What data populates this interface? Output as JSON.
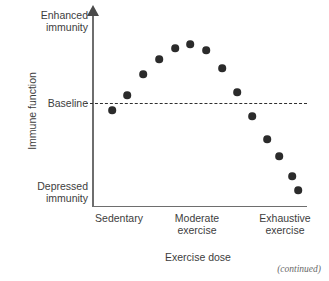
{
  "figure": {
    "continued_note": "(continued)"
  },
  "chart_data": {
    "type": "scatter",
    "title": "",
    "xlabel": "Exercise dose",
    "ylabel": "Immune function",
    "grid": false,
    "legend": null,
    "xlim": [
      0,
      1
    ],
    "ylim": [
      0,
      1
    ],
    "x_tick_labels": [
      "Sedentary",
      "Moderate\nexercise",
      "Exhaustive\nexercise"
    ],
    "y_tick_labels": [
      "Enhanced\nimmunity",
      "Baseline",
      "Depressed\nimmunity"
    ],
    "annotations": [
      {
        "name": "baseline-reference-line",
        "label": "Baseline",
        "style": "dashed",
        "y": 0.5
      }
    ],
    "marker": {
      "shape": "circle",
      "color": "#2b2b2b",
      "size_px": 7.6
    },
    "point_count": 14,
    "points": [
      {
        "x": 0.09,
        "y": 0.475,
        "px": 112,
        "py": 110
      },
      {
        "x": 0.16,
        "y": 0.555,
        "px": 127,
        "py": 95
      },
      {
        "x": 0.235,
        "y": 0.665,
        "px": 143,
        "py": 74
      },
      {
        "x": 0.31,
        "y": 0.745,
        "px": 159,
        "py": 59
      },
      {
        "x": 0.385,
        "y": 0.805,
        "px": 175,
        "py": 48
      },
      {
        "x": 0.455,
        "y": 0.825,
        "px": 190,
        "py": 44
      },
      {
        "x": 0.53,
        "y": 0.795,
        "px": 206,
        "py": 50
      },
      {
        "x": 0.605,
        "y": 0.7,
        "px": 222,
        "py": 68
      },
      {
        "x": 0.675,
        "y": 0.57,
        "px": 237,
        "py": 92
      },
      {
        "x": 0.745,
        "y": 0.445,
        "px": 252,
        "py": 116
      },
      {
        "x": 0.815,
        "y": 0.32,
        "px": 267,
        "py": 139
      },
      {
        "x": 0.87,
        "y": 0.23,
        "px": 279,
        "py": 156
      },
      {
        "x": 0.93,
        "y": 0.125,
        "px": 292,
        "py": 176
      },
      {
        "x": 0.96,
        "y": 0.05,
        "px": 298,
        "py": 190
      }
    ]
  },
  "axes": {
    "y": {
      "title": "Immune function",
      "labels": {
        "top": "Enhanced\nimmunity",
        "middle": "Baseline",
        "bottom": "Depressed\nimmunity"
      }
    },
    "x": {
      "title": "Exercise dose",
      "labels": {
        "left": "Sedentary",
        "center": "Moderate\nexercise",
        "right": "Exhaustive\nexercise"
      }
    }
  }
}
